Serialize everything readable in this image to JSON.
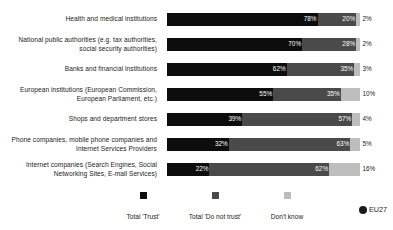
{
  "chart_data": {
    "type": "bar",
    "subtype": "stacked-horizontal-100pct",
    "title": "",
    "xlabel": "",
    "ylabel": "",
    "xlim": [
      0,
      100
    ],
    "grid": false,
    "legend_position": "bottom",
    "unit": "%",
    "categories": [
      "Health and medical institutions",
      "National public authorities (e.g. tax authorities, social security authorities)",
      "Banks and financial institutions",
      "European institutions (European Commission, European Parliament, etc.)",
      "Shops and department stores",
      "Phone companies, mobile phone companies and Internet Services Providers",
      "Internet companies (Search Engines, Social Networking Sites, E-mail Services)"
    ],
    "series": [
      {
        "name": "Total 'Trust'",
        "color": "#0d0d0d",
        "values": [
          78,
          70,
          62,
          55,
          39,
          32,
          22
        ]
      },
      {
        "name": "Total 'Do not trust'",
        "color": "#4a4a4a",
        "values": [
          20,
          28,
          35,
          35,
          57,
          63,
          62
        ]
      },
      {
        "name": "Don't know",
        "color": "#bdbdbd",
        "values": [
          2,
          2,
          3,
          10,
          4,
          5,
          16
        ]
      }
    ]
  },
  "rows": [
    {
      "label_lines": [
        "Health and medical institutions"
      ],
      "segments": [
        {
          "series": "Total 'Trust'",
          "value": 78,
          "value_label": "78%",
          "placement": "inside"
        },
        {
          "series": "Total 'Do not trust'",
          "value": 20,
          "value_label": "20%",
          "placement": "inside"
        },
        {
          "series": "Don't know",
          "value": 2,
          "value_label": "2%",
          "placement": "outside"
        }
      ]
    },
    {
      "label_lines": [
        "National public authorities (e.g. tax authorities,",
        "social security authorities)"
      ],
      "segments": [
        {
          "series": "Total 'Trust'",
          "value": 70,
          "value_label": "70%",
          "placement": "inside"
        },
        {
          "series": "Total 'Do not trust'",
          "value": 28,
          "value_label": "28%",
          "placement": "inside"
        },
        {
          "series": "Don't know",
          "value": 2,
          "value_label": "2%",
          "placement": "outside"
        }
      ]
    },
    {
      "label_lines": [
        "Banks and financial institutions"
      ],
      "segments": [
        {
          "series": "Total 'Trust'",
          "value": 62,
          "value_label": "62%",
          "placement": "inside"
        },
        {
          "series": "Total 'Do not trust'",
          "value": 35,
          "value_label": "35%",
          "placement": "inside"
        },
        {
          "series": "Don't know",
          "value": 3,
          "value_label": "3%",
          "placement": "outside"
        }
      ]
    },
    {
      "label_lines": [
        "European institutions (European Commission,",
        "European Parliament, etc.)"
      ],
      "segments": [
        {
          "series": "Total 'Trust'",
          "value": 55,
          "value_label": "55%",
          "placement": "inside"
        },
        {
          "series": "Total 'Do not trust'",
          "value": 35,
          "value_label": "35%",
          "placement": "inside"
        },
        {
          "series": "Don't know",
          "value": 10,
          "value_label": "10%",
          "placement": "outside"
        }
      ]
    },
    {
      "label_lines": [
        "Shops and department stores"
      ],
      "segments": [
        {
          "series": "Total 'Trust'",
          "value": 39,
          "value_label": "39%",
          "placement": "inside"
        },
        {
          "series": "Total 'Do not trust'",
          "value": 57,
          "value_label": "57%",
          "placement": "inside"
        },
        {
          "series": "Don't know",
          "value": 4,
          "value_label": "4%",
          "placement": "outside"
        }
      ]
    },
    {
      "label_lines": [
        "Phone companies, mobile phone companies and",
        "Internet Services Providers"
      ],
      "segments": [
        {
          "series": "Total 'Trust'",
          "value": 32,
          "value_label": "32%",
          "placement": "inside"
        },
        {
          "series": "Total 'Do not trust'",
          "value": 63,
          "value_label": "63%",
          "placement": "inside"
        },
        {
          "series": "Don't know",
          "value": 5,
          "value_label": "5%",
          "placement": "outside"
        }
      ]
    },
    {
      "label_lines": [
        "Internet companies (Search Engines, Social",
        "Networking Sites, E-mail Services)"
      ],
      "segments": [
        {
          "series": "Total 'Trust'",
          "value": 22,
          "value_label": "22%",
          "placement": "inside"
        },
        {
          "series": "Total 'Do not trust'",
          "value": 62,
          "value_label": "62%",
          "placement": "inside"
        },
        {
          "series": "Don't know",
          "value": 16,
          "value_label": "16%",
          "placement": "outside"
        }
      ]
    }
  ],
  "legend": {
    "items": [
      {
        "label": "Total 'Trust'",
        "color": "#0d0d0d"
      },
      {
        "label": "Total 'Do not trust'",
        "color": "#4a4a4a"
      },
      {
        "label": "Don't know",
        "color": "#bdbdbd"
      }
    ]
  },
  "badge": {
    "label": "EU27",
    "color": "#1b1b1b"
  }
}
